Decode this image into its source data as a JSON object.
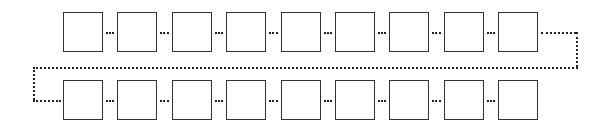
{
  "diagram": {
    "type": "serpentine-chain",
    "rows": 2,
    "boxes_per_row": 9,
    "box_size": 40,
    "row1_top": 12,
    "row2_top": 80,
    "first_box_left": 63,
    "pitch": 54.4,
    "connector_style": "dotted",
    "colors": {
      "stroke": "#333333",
      "dots": "#222222",
      "background": "#ffffff"
    }
  }
}
